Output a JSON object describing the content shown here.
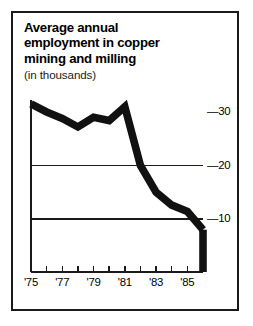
{
  "figure": {
    "title_lines": [
      "Average annual",
      "employment in copper",
      "mining and milling"
    ],
    "subtitle": "(in thousands)",
    "frame_color": "#1a1a1a",
    "line_color": "#111111",
    "background": "#ffffff"
  },
  "chart_data": {
    "type": "line",
    "title": "Average annual employment in copper mining and milling",
    "subtitle": "(in thousands)",
    "xlabel": "",
    "ylabel": "",
    "units": "thousands",
    "grid": true,
    "legend": null,
    "xlim": [
      1975,
      1986
    ],
    "ylim": [
      0,
      34
    ],
    "x": [
      1975,
      1976,
      1977,
      1978,
      1979,
      1980,
      1981,
      1982,
      1983,
      1984,
      1985,
      1986
    ],
    "values": [
      31.5,
      30.0,
      28.8,
      27.2,
      29.0,
      28.4,
      31.0,
      20.0,
      15.0,
      12.6,
      11.4,
      8.0
    ],
    "x_tick_values": [
      1975,
      1976,
      1977,
      1978,
      1979,
      1980,
      1981,
      1982,
      1983,
      1984,
      1985
    ],
    "x_tick_labels": [
      "'75",
      "",
      "'77",
      "",
      "'79",
      "",
      "'81",
      "",
      "'83",
      "",
      "'85"
    ],
    "x_labeled": [
      "'75",
      "'77",
      "'79",
      "'81",
      "'83",
      "'85"
    ],
    "y_ticks": [
      10,
      20,
      30
    ],
    "y_tick_labels": [
      "—10",
      "—20",
      "—30"
    ],
    "gridline_values": [
      10,
      20
    ],
    "series": [
      {
        "name": "Average annual employment in copper mining and milling",
        "values": [
          31.5,
          30.0,
          28.8,
          27.2,
          29.0,
          28.4,
          31.0,
          20.0,
          15.0,
          12.6,
          11.4,
          8.0
        ]
      }
    ]
  },
  "axis": {
    "y_labels": [
      {
        "text": "—30",
        "value": 30
      },
      {
        "text": "—20",
        "value": 20
      },
      {
        "text": "—10",
        "value": 10
      }
    ],
    "x_labels": [
      {
        "text": "'75",
        "value": 1975
      },
      {
        "text": "'77",
        "value": 1977
      },
      {
        "text": "'79",
        "value": 1979
      },
      {
        "text": "'81",
        "value": 1981
      },
      {
        "text": "'83",
        "value": 1983
      },
      {
        "text": "'85",
        "value": 1985
      }
    ]
  }
}
